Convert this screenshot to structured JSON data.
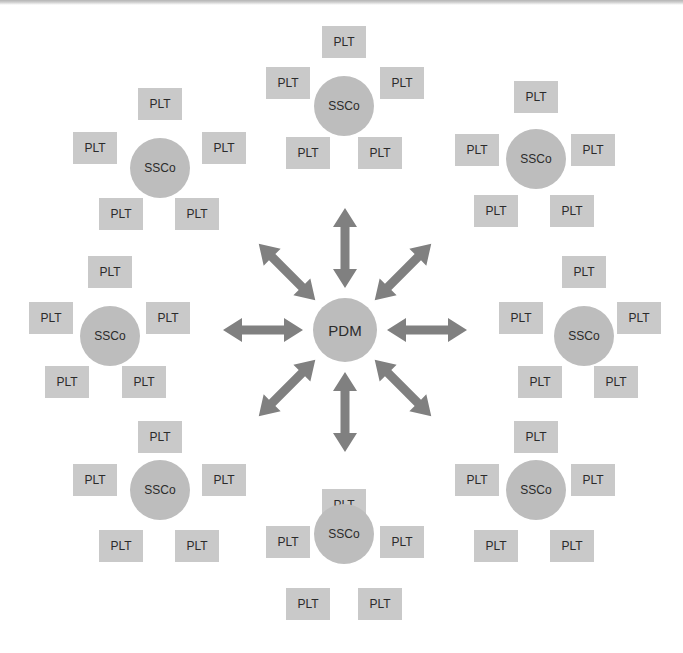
{
  "diagram": {
    "type": "hub-and-spoke network diagram",
    "background_color": "#ffffff",
    "hub": {
      "label": "PDM",
      "cx": 345,
      "cy": 330,
      "r": 32,
      "color": "#bcbcbc",
      "text_color": "#2b2b2b",
      "font_size": 15
    },
    "arrow": {
      "color": "#808080",
      "double_headed": true,
      "count": 8,
      "shaft_width": 9,
      "head_width": 24,
      "head_length": 19,
      "inner_radius": 42,
      "outer_radius": 122
    },
    "ssco_node": {
      "label": "SSCo",
      "r": 30,
      "color": "#bdbdbd",
      "text_color": "#2b2b2b",
      "font_size": 12
    },
    "plt_node": {
      "label": "PLT",
      "width": 44,
      "height": 32,
      "color": "#c9c9c9",
      "text_color": "#2b2b2b",
      "font_size": 12
    },
    "clusters": [
      {
        "name": "cluster-north",
        "direction": "north",
        "ssco": {
          "cx": 344,
          "cy": 106
        },
        "plts": [
          {
            "cx": 344,
            "cy": 42
          },
          {
            "cx": 288,
            "cy": 83
          },
          {
            "cx": 402,
            "cy": 83
          },
          {
            "cx": 308,
            "cy": 153
          },
          {
            "cx": 380,
            "cy": 153
          }
        ]
      },
      {
        "name": "cluster-northwest",
        "direction": "northwest",
        "ssco": {
          "cx": 160,
          "cy": 168
        },
        "plts": [
          {
            "cx": 160,
            "cy": 104
          },
          {
            "cx": 95,
            "cy": 148
          },
          {
            "cx": 224,
            "cy": 148
          },
          {
            "cx": 121,
            "cy": 214
          },
          {
            "cx": 197,
            "cy": 214
          }
        ]
      },
      {
        "name": "cluster-northeast",
        "direction": "northeast",
        "ssco": {
          "cx": 536,
          "cy": 159
        },
        "plts": [
          {
            "cx": 536,
            "cy": 97
          },
          {
            "cx": 477,
            "cy": 150
          },
          {
            "cx": 593,
            "cy": 150
          },
          {
            "cx": 496,
            "cy": 211
          },
          {
            "cx": 572,
            "cy": 211
          }
        ]
      },
      {
        "name": "cluster-west",
        "direction": "west",
        "ssco": {
          "cx": 110,
          "cy": 336
        },
        "plts": [
          {
            "cx": 110,
            "cy": 272
          },
          {
            "cx": 51,
            "cy": 318
          },
          {
            "cx": 168,
            "cy": 318
          },
          {
            "cx": 67,
            "cy": 382
          },
          {
            "cx": 144,
            "cy": 382
          }
        ]
      },
      {
        "name": "cluster-east",
        "direction": "east",
        "ssco": {
          "cx": 584,
          "cy": 336
        },
        "plts": [
          {
            "cx": 584,
            "cy": 272
          },
          {
            "cx": 521,
            "cy": 318
          },
          {
            "cx": 639,
            "cy": 318
          },
          {
            "cx": 540,
            "cy": 382
          },
          {
            "cx": 616,
            "cy": 382
          }
        ]
      },
      {
        "name": "cluster-southwest",
        "direction": "southwest",
        "ssco": {
          "cx": 160,
          "cy": 490
        },
        "plts": [
          {
            "cx": 160,
            "cy": 437
          },
          {
            "cx": 95,
            "cy": 480
          },
          {
            "cx": 224,
            "cy": 480
          },
          {
            "cx": 121,
            "cy": 546
          },
          {
            "cx": 197,
            "cy": 546
          }
        ]
      },
      {
        "name": "cluster-southeast",
        "direction": "southeast",
        "ssco": {
          "cx": 536,
          "cy": 490
        },
        "plts": [
          {
            "cx": 536,
            "cy": 437
          },
          {
            "cx": 477,
            "cy": 480
          },
          {
            "cx": 593,
            "cy": 480
          },
          {
            "cx": 496,
            "cy": 546
          },
          {
            "cx": 572,
            "cy": 546
          }
        ]
      },
      {
        "name": "cluster-south",
        "direction": "south",
        "ssco": {
          "cx": 344,
          "cy": 534
        },
        "plts": [
          {
            "cx": 344,
            "cy": 505
          },
          {
            "cx": 288,
            "cy": 542
          },
          {
            "cx": 402,
            "cy": 542
          },
          {
            "cx": 308,
            "cy": 604
          },
          {
            "cx": 380,
            "cy": 604
          }
        ]
      }
    ],
    "arrows": [
      {
        "name": "arrow-hub-north",
        "angle_deg": 270
      },
      {
        "name": "arrow-hub-northeast",
        "angle_deg": 315
      },
      {
        "name": "arrow-hub-east",
        "angle_deg": 0
      },
      {
        "name": "arrow-hub-southeast",
        "angle_deg": 45
      },
      {
        "name": "arrow-hub-south",
        "angle_deg": 90
      },
      {
        "name": "arrow-hub-southwest",
        "angle_deg": 135
      },
      {
        "name": "arrow-hub-west",
        "angle_deg": 180
      },
      {
        "name": "arrow-hub-northwest",
        "angle_deg": 225
      }
    ]
  }
}
